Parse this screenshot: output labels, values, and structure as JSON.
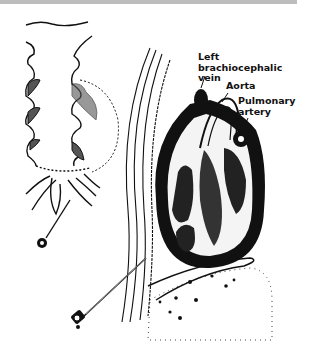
{
  "figure": {
    "labels": {
      "left_brachiocephalic_vein": [
        "Left",
        "brachiocephalic",
        "vein"
      ],
      "aorta": "Aorta",
      "pulmonary_artery": [
        "Pulmonary",
        "artery"
      ]
    },
    "colors": {
      "ink": "#111111",
      "background": "#ffffff",
      "top_bar": "#bdbdbd"
    }
  }
}
